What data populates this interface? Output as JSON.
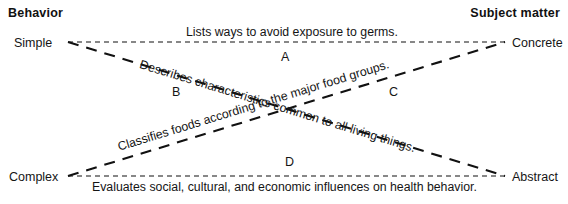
{
  "figure": {
    "type": "two-axis-crossed-matrix",
    "background_color": "#ffffff",
    "line_color": "#111111",
    "text_color": "#151515"
  },
  "headers": {
    "left": "Behavior",
    "right": "Subject matter"
  },
  "axis_labels": {
    "top_left": "Simple",
    "bottom_left": "Complex",
    "top_right": "Concrete",
    "bottom_right": "Abstract"
  },
  "items": [
    {
      "marker": "A",
      "text": "Lists ways to avoid exposure to germs.",
      "path": "top-horizontal",
      "from": "Simple",
      "to": "Concrete"
    },
    {
      "marker": "B",
      "text": "Describes characteristics common to all living things.",
      "path": "descending-diagonal",
      "from": "Simple",
      "to": "Abstract"
    },
    {
      "marker": "C",
      "text": "Classifies foods according to the major food groups.",
      "path": "ascending-diagonal",
      "from": "Complex",
      "to": "Concrete"
    },
    {
      "marker": "D",
      "text": "Evaluates social, cultural, and economic influences on health behavior.",
      "path": "bottom-horizontal",
      "from": "Complex",
      "to": "Abstract"
    }
  ]
}
